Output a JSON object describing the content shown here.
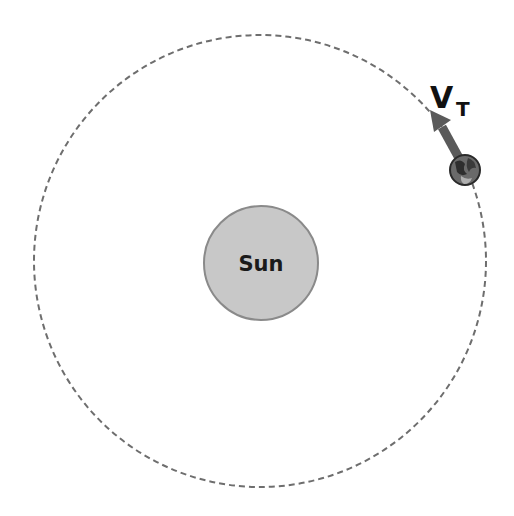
{
  "diagram": {
    "title": "",
    "sun": {
      "label": "Sun",
      "fill": "#c8c8c8",
      "stroke": "#8a8a8a"
    },
    "orbit": {
      "style": "dashed",
      "stroke": "#6e6e6e"
    },
    "planet": {
      "name": "Earth",
      "fill": "#555555"
    },
    "velocity_vector": {
      "label": "V",
      "subscript": "T",
      "color": "#5a5a5a"
    }
  }
}
